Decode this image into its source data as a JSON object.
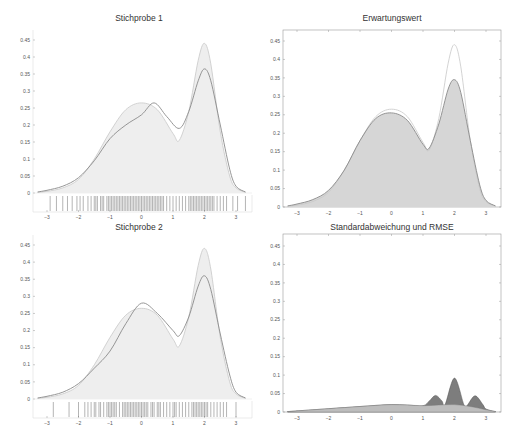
{
  "chart_data": [
    {
      "type": "area",
      "title": "Stichprobe 1",
      "xlabel": "",
      "ylabel": "",
      "xlim": [
        -3.3,
        3.5
      ],
      "ylim": [
        0,
        0.45
      ],
      "xticks": [
        -3,
        -2,
        -1,
        0,
        1,
        2,
        3
      ],
      "yticks": [
        0,
        0.05,
        0.1,
        0.15,
        0.2,
        0.25,
        0.3,
        0.35,
        0.4,
        0.45
      ],
      "ytick_labels": [
        "0",
        "0.05",
        "0.1",
        "0.15",
        "0.2",
        "0.25",
        "0.3",
        "0.35",
        "0.4",
        "0.45"
      ],
      "grid": false,
      "rug_plot": true,
      "series": [
        {
          "name": "true density",
          "x": [
            -3.3,
            -3,
            -2.5,
            -2,
            -1.5,
            -1,
            -0.5,
            0,
            0.5,
            1,
            1.2,
            1.5,
            1.8,
            2,
            2.2,
            2.5,
            2.8,
            3,
            3.3
          ],
          "values": [
            0.002,
            0.005,
            0.015,
            0.04,
            0.1,
            0.18,
            0.245,
            0.265,
            0.245,
            0.175,
            0.155,
            0.24,
            0.39,
            0.44,
            0.38,
            0.18,
            0.05,
            0.015,
            0.002
          ]
        },
        {
          "name": "kernel estimate",
          "x": [
            -3.3,
            -3,
            -2.5,
            -2,
            -1.5,
            -1,
            -0.5,
            0,
            0.4,
            0.8,
            1.2,
            1.5,
            1.8,
            2,
            2.2,
            2.5,
            2.8,
            3,
            3.3
          ],
          "values": [
            0.003,
            0.008,
            0.02,
            0.045,
            0.095,
            0.16,
            0.2,
            0.23,
            0.265,
            0.225,
            0.19,
            0.24,
            0.33,
            0.365,
            0.33,
            0.2,
            0.07,
            0.02,
            0.003
          ]
        }
      ]
    },
    {
      "type": "area",
      "title": "Erwartungswert",
      "xlabel": "",
      "ylabel": "",
      "xlim": [
        -3.3,
        3.5
      ],
      "ylim": [
        0,
        0.47
      ],
      "xticks": [
        -3,
        -2,
        -1,
        0,
        1,
        2,
        3
      ],
      "yticks": [
        0,
        0.05,
        0.1,
        0.15,
        0.2,
        0.25,
        0.3,
        0.35,
        0.4,
        0.45
      ],
      "ytick_labels": [
        "0",
        "0.05",
        "0.1",
        "0.15",
        "0.2",
        "0.25",
        "0.3",
        "0.35",
        "0.4",
        "0.45"
      ],
      "grid": false,
      "series": [
        {
          "name": "true density",
          "x": [
            -3.3,
            -3,
            -2.5,
            -2,
            -1.5,
            -1,
            -0.5,
            0,
            0.5,
            1,
            1.2,
            1.5,
            1.8,
            2,
            2.2,
            2.5,
            2.8,
            3,
            3.3
          ],
          "values": [
            0.002,
            0.005,
            0.015,
            0.04,
            0.1,
            0.18,
            0.245,
            0.265,
            0.245,
            0.175,
            0.155,
            0.24,
            0.39,
            0.44,
            0.38,
            0.18,
            0.05,
            0.015,
            0.002
          ]
        },
        {
          "name": "expected value",
          "x": [
            -3.3,
            -3,
            -2.5,
            -2,
            -1.5,
            -1,
            -0.5,
            0,
            0.5,
            1,
            1.2,
            1.5,
            1.8,
            2,
            2.2,
            2.5,
            2.8,
            3,
            3.3
          ],
          "values": [
            0.003,
            0.008,
            0.02,
            0.045,
            0.1,
            0.18,
            0.24,
            0.255,
            0.235,
            0.17,
            0.16,
            0.225,
            0.32,
            0.345,
            0.31,
            0.18,
            0.06,
            0.018,
            0.003
          ]
        }
      ]
    },
    {
      "type": "area",
      "title": "Stichprobe 2",
      "xlabel": "",
      "ylabel": "",
      "xlim": [
        -3.3,
        3.5
      ],
      "ylim": [
        0,
        0.45
      ],
      "xticks": [
        -3,
        -2,
        -1,
        0,
        1,
        2,
        3
      ],
      "yticks": [
        0,
        0.05,
        0.1,
        0.15,
        0.2,
        0.25,
        0.3,
        0.35,
        0.4,
        0.45
      ],
      "ytick_labels": [
        "0",
        "0.05",
        "0.1",
        "0.15",
        "0.2",
        "0.25",
        "0.3",
        "0.35",
        "0.4",
        "0.45"
      ],
      "grid": false,
      "rug_plot": true,
      "series": [
        {
          "name": "true density",
          "x": [
            -3.3,
            -3,
            -2.5,
            -2,
            -1.5,
            -1,
            -0.5,
            0,
            0.5,
            1,
            1.2,
            1.5,
            1.8,
            2,
            2.2,
            2.5,
            2.8,
            3,
            3.3
          ],
          "values": [
            0.002,
            0.005,
            0.015,
            0.04,
            0.1,
            0.18,
            0.245,
            0.265,
            0.245,
            0.175,
            0.155,
            0.24,
            0.39,
            0.44,
            0.38,
            0.18,
            0.05,
            0.015,
            0.002
          ]
        },
        {
          "name": "kernel estimate",
          "x": [
            -3.3,
            -3,
            -2.5,
            -2,
            -1.5,
            -1,
            -0.5,
            0,
            0.5,
            1,
            1.2,
            1.5,
            1.8,
            2,
            2.2,
            2.5,
            2.8,
            3,
            3.3
          ],
          "values": [
            0.003,
            0.008,
            0.02,
            0.045,
            0.09,
            0.14,
            0.22,
            0.28,
            0.25,
            0.2,
            0.185,
            0.24,
            0.33,
            0.36,
            0.32,
            0.19,
            0.07,
            0.02,
            0.003
          ]
        }
      ]
    },
    {
      "type": "area",
      "title": "Standardabweichung und RMSE",
      "xlabel": "",
      "ylabel": "",
      "xlim": [
        -3.3,
        3.5
      ],
      "ylim": [
        0,
        0.47
      ],
      "xticks": [
        -3,
        -2,
        -1,
        0,
        1,
        2,
        3
      ],
      "yticks": [
        0,
        0.05,
        0.1,
        0.15,
        0.2,
        0.25,
        0.3,
        0.35,
        0.4,
        0.45
      ],
      "ytick_labels": [
        "0",
        "0.05",
        "0.1",
        "0.15",
        "0.2",
        "0.25",
        "0.3",
        "0.35",
        "0.4",
        "0.45"
      ],
      "grid": false,
      "series": [
        {
          "name": "Standardabweichung",
          "x": [
            -3.3,
            -3,
            -2.5,
            -2,
            -1.5,
            -1,
            -0.5,
            0,
            0.5,
            1,
            1.5,
            2,
            2.5,
            3,
            3.3
          ],
          "values": [
            0.001,
            0.003,
            0.006,
            0.009,
            0.012,
            0.015,
            0.018,
            0.02,
            0.019,
            0.017,
            0.019,
            0.02,
            0.015,
            0.006,
            0.001
          ]
        },
        {
          "name": "RMSE",
          "x": [
            -3.3,
            -3,
            -2.5,
            -2,
            -1.5,
            -1,
            -0.5,
            0,
            0.5,
            1,
            1.2,
            1.4,
            1.6,
            1.7,
            2,
            2.3,
            2.4,
            2.65,
            2.9,
            3,
            3.3
          ],
          "values": [
            0.001,
            0.003,
            0.006,
            0.009,
            0.012,
            0.015,
            0.018,
            0.02,
            0.019,
            0.017,
            0.03,
            0.045,
            0.03,
            0.02,
            0.092,
            0.02,
            0.018,
            0.044,
            0.02,
            0.008,
            0.001
          ]
        }
      ]
    }
  ],
  "rug": {
    "sample1": [
      -2.9,
      -2.7,
      -2.5,
      -2.35,
      -2.2,
      -2.05,
      -1.95,
      -1.85,
      -1.7,
      -1.6,
      -1.5,
      -1.45,
      -1.4,
      -1.3,
      -1.25,
      -1.2,
      -1.1,
      -1.05,
      -1.0,
      -0.95,
      -0.9,
      -0.85,
      -0.8,
      -0.75,
      -0.7,
      -0.65,
      -0.6,
      -0.55,
      -0.5,
      -0.45,
      -0.4,
      -0.35,
      -0.3,
      -0.25,
      -0.2,
      -0.15,
      -0.1,
      -0.05,
      0,
      0.05,
      0.1,
      0.15,
      0.2,
      0.25,
      0.3,
      0.35,
      0.4,
      0.45,
      0.5,
      0.55,
      0.6,
      0.65,
      0.7,
      0.8,
      0.9,
      1.0,
      1.1,
      1.2,
      1.3,
      1.4,
      1.5,
      1.55,
      1.6,
      1.65,
      1.7,
      1.75,
      1.8,
      1.85,
      1.9,
      1.95,
      2.0,
      2.05,
      2.1,
      2.15,
      2.2,
      2.25,
      2.3,
      2.4,
      2.5,
      2.6,
      2.7,
      2.9,
      3.05,
      3.3
    ],
    "sample2": [
      -2.8,
      -2.3,
      -2.0,
      -1.8,
      -1.7,
      -1.6,
      -1.5,
      -1.45,
      -1.35,
      -1.3,
      -1.2,
      -1.1,
      -1.05,
      -1.0,
      -0.95,
      -0.9,
      -0.85,
      -0.8,
      -0.7,
      -0.6,
      -0.55,
      -0.5,
      -0.45,
      -0.4,
      -0.35,
      -0.3,
      -0.25,
      -0.2,
      -0.15,
      -0.1,
      -0.05,
      0,
      0.05,
      0.1,
      0.15,
      0.2,
      0.3,
      0.35,
      0.4,
      0.5,
      0.55,
      0.6,
      0.7,
      0.8,
      0.9,
      1.0,
      1.05,
      1.1,
      1.2,
      1.3,
      1.4,
      1.5,
      1.6,
      1.65,
      1.7,
      1.75,
      1.8,
      1.85,
      1.9,
      1.95,
      2.0,
      2.05,
      2.1,
      2.2,
      2.3,
      2.4,
      2.5,
      2.6,
      2.7,
      3.0
    ]
  },
  "colors": {
    "true_line": "#c8c8c8",
    "estimate_line": "#8a8a8a",
    "fill_light": "#eeeeee",
    "fill_mid": "#d6d6d6",
    "rmse_fill": "#7d7d7d",
    "std_fill": "#bdbdbd",
    "axis": "#999999"
  }
}
